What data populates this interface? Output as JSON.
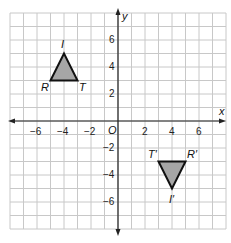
{
  "chart_data": {
    "type": "coordinate-plane",
    "title": "",
    "xlabel": "x",
    "ylabel": "y",
    "xlim": [
      -8,
      8
    ],
    "ylim": [
      -8,
      8
    ],
    "grid": true,
    "origin_label": "O",
    "x_ticks": [
      -6,
      -4,
      -2,
      2,
      4,
      6
    ],
    "x_tick_labels": [
      "−6",
      "−4",
      "−2",
      "2",
      "4",
      "6"
    ],
    "y_ticks": [
      6,
      4,
      2,
      -2,
      -4,
      -6
    ],
    "y_tick_labels": [
      "6",
      "4",
      "2",
      "−2",
      "−4",
      "−6"
    ],
    "shapes": [
      {
        "name": "Triangle RIT",
        "fill": "#a6a6a6",
        "stroke": "#111111",
        "vertices": [
          {
            "label": "R",
            "x": -5,
            "y": 3
          },
          {
            "label": "I",
            "x": -4,
            "y": 5
          },
          {
            "label": "T",
            "x": -3,
            "y": 3
          }
        ]
      },
      {
        "name": "Triangle R'I'T'",
        "fill": "#a6a6a6",
        "stroke": "#111111",
        "vertices": [
          {
            "label": "R′",
            "x": 5,
            "y": -3
          },
          {
            "label": "I′",
            "x": 4,
            "y": -5
          },
          {
            "label": "T′",
            "x": 3,
            "y": -3
          }
        ]
      }
    ]
  },
  "labels": {
    "x_axis": "x",
    "y_axis": "y",
    "origin": "O",
    "R": "R",
    "I": "I",
    "T": "T",
    "R_prime": "R′",
    "I_prime": "I′",
    "T_prime": "T′",
    "xt_m6": "−6",
    "xt_m4": "−4",
    "xt_m2": "−2",
    "xt_2": "2",
    "xt_4": "4",
    "xt_6": "6",
    "yt_6": "6",
    "yt_4": "4",
    "yt_2": "2",
    "yt_m2": "−2",
    "yt_m4": "−4",
    "yt_m6": "−6"
  },
  "colors": {
    "grid": "#c8c8c8",
    "axis": "#222222",
    "triangle_fill": "#a6a6a6",
    "triangle_stroke": "#111111"
  }
}
